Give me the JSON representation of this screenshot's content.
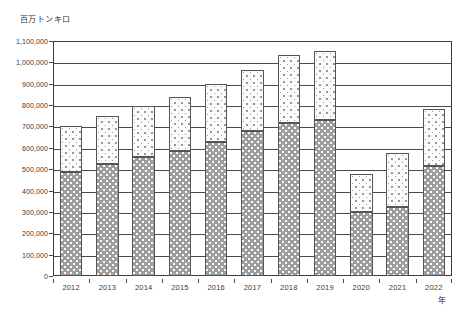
{
  "chart_data": {
    "type": "bar",
    "stacked": true,
    "title": "",
    "subtitle": "",
    "xlabel": "年",
    "ylabel": "百万トンキロ",
    "categories": [
      "2012",
      "2013",
      "2014",
      "2015",
      "2016",
      "2017",
      "2018",
      "2019",
      "2020",
      "2021",
      "2022"
    ],
    "series": [
      {
        "name": "lower-segment",
        "fill": "dark-dotted",
        "values": [
          485000,
          525000,
          558000,
          585000,
          625000,
          680000,
          715000,
          730000,
          298000,
          325000,
          515000
        ]
      },
      {
        "name": "upper-segment",
        "fill": "light-dotted",
        "values": [
          215000,
          225000,
          237000,
          255000,
          275000,
          285000,
          320000,
          325000,
          179000,
          250000,
          267000
        ]
      }
    ],
    "totals": [
      700000,
      750000,
      795000,
      840000,
      900000,
      965000,
      1035000,
      1055000,
      477000,
      575000,
      782000
    ],
    "ylim": [
      0,
      1100000
    ],
    "ytick_step": 100000,
    "ytick_labels": [
      "1,100,000",
      "1,000,000",
      "900,000",
      "800,000",
      "700,000",
      "600,000",
      "500,000",
      "400,000",
      "300,000",
      "200,000",
      "100,000",
      "0"
    ],
    "ytick_values": [
      1100000,
      1000000,
      900000,
      800000,
      700000,
      600000,
      500000,
      400000,
      300000,
      200000,
      100000,
      0
    ],
    "grid": true,
    "grid_axis": "y",
    "legend": "none",
    "legend_position": "none",
    "colors": {
      "plot_border": "#3c3c3c",
      "gridline": "#4a4a4a",
      "bar_outline": "#555555",
      "segment_lower_fill": "#9d9d9d",
      "segment_upper_fill": "#fbfbfb",
      "text": "#3b3b3b",
      "background": "#ffffff"
    }
  }
}
